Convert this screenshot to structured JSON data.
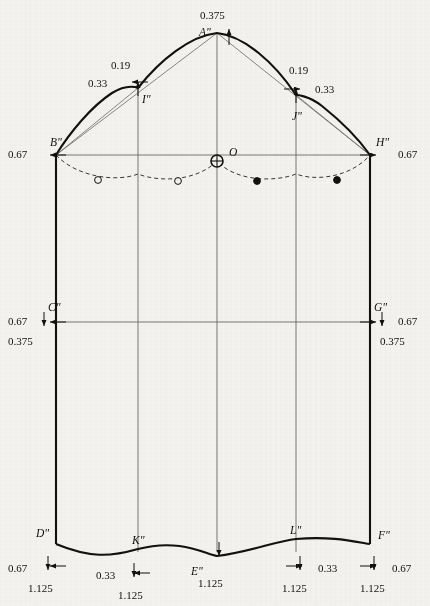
{
  "figure": {
    "kind": "technical-pattern-drafting-diagram",
    "background_color": "#f4f2ee",
    "ink_color": "#111111",
    "line_color_thin": "#555555"
  },
  "points": [
    {
      "id": "A",
      "label": "A\"",
      "x": 217,
      "y": 33,
      "label_dx": -18,
      "label_dy": -6
    },
    {
      "id": "B",
      "label": "B\"",
      "x": 56,
      "y": 155,
      "label_dx": -6,
      "label_dy": -18
    },
    {
      "id": "C",
      "label": "C\"",
      "x": 56,
      "y": 322,
      "label_dx": -8,
      "label_dy": -20
    },
    {
      "id": "D",
      "label": "D\"",
      "x": 56,
      "y": 544,
      "label_dx": -20,
      "label_dy": -16
    },
    {
      "id": "E",
      "label": "E\"",
      "x": 217,
      "y": 556,
      "label_dx": -26,
      "label_dy": 10
    },
    {
      "id": "F",
      "label": "F\"",
      "x": 370,
      "y": 544,
      "label_dx": 8,
      "label_dy": -14
    },
    {
      "id": "G",
      "label": "G\"",
      "x": 370,
      "y": 322,
      "label_dx": 4,
      "label_dy": -20
    },
    {
      "id": "H",
      "label": "H\"",
      "x": 370,
      "y": 155,
      "label_dx": 6,
      "label_dy": -18
    },
    {
      "id": "I",
      "label": "I\"",
      "x": 138,
      "y": 88,
      "label_dx": 4,
      "label_dy": 6
    },
    {
      "id": "J",
      "label": "J\"",
      "x": 296,
      "y": 95,
      "label_dx": -4,
      "label_dy": 16
    },
    {
      "id": "K",
      "label": "K\"",
      "x": 138,
      "y": 549,
      "label_dx": -6,
      "label_dy": -14
    },
    {
      "id": "L",
      "label": "L\"",
      "x": 296,
      "y": 539,
      "label_dx": -6,
      "label_dy": -14
    },
    {
      "id": "O",
      "label": "O",
      "x": 217,
      "y": 161,
      "label_dx": 12,
      "label_dy": -14
    }
  ],
  "dimensions": [
    {
      "id": "a-up",
      "value": "0.375",
      "near": "A\"",
      "direction": "up",
      "text_x": 200,
      "text_y": 10,
      "arrow_x": 229,
      "arrow_y": 29,
      "arrow_len": 16
    },
    {
      "id": "i-up",
      "value": "0.19",
      "near": "I\"",
      "direction": "up",
      "text_x": 111,
      "text_y": 60,
      "arrow_x": 138,
      "arrow_y": 82,
      "arrow_len": 14
    },
    {
      "id": "i-left",
      "value": "0.33",
      "near": "I\"",
      "direction": "left",
      "text_x": 88,
      "text_y": 78,
      "arrow_x": 132,
      "arrow_y": 82,
      "arrow_len": 16
    },
    {
      "id": "j-up",
      "value": "0.19",
      "near": "J\"",
      "direction": "up",
      "text_x": 289,
      "text_y": 65,
      "arrow_x": 296,
      "arrow_y": 89,
      "arrow_len": 14
    },
    {
      "id": "j-right",
      "value": "0.33",
      "near": "J\"",
      "direction": "right",
      "text_x": 315,
      "text_y": 84,
      "arrow_x": 300,
      "arrow_y": 89,
      "arrow_len": 16
    },
    {
      "id": "b-left",
      "value": "0.67",
      "near": "B\"",
      "direction": "left",
      "text_x": 8,
      "text_y": 149,
      "arrow_x": 50,
      "arrow_y": 155,
      "arrow_len": 16
    },
    {
      "id": "h-right",
      "value": "0.67",
      "near": "H\"",
      "direction": "right",
      "text_x": 398,
      "text_y": 149,
      "arrow_x": 376,
      "arrow_y": 155,
      "arrow_len": 16
    },
    {
      "id": "c-left",
      "value": "0.67",
      "near": "C\"",
      "direction": "left",
      "text_x": 8,
      "text_y": 316,
      "arrow_x": 50,
      "arrow_y": 322,
      "arrow_len": 16
    },
    {
      "id": "c-down",
      "value": "0.375",
      "near": "C\"",
      "direction": "down",
      "text_x": 8,
      "text_y": 336,
      "arrow_x": 44,
      "arrow_y": 326,
      "arrow_len": 14
    },
    {
      "id": "g-right",
      "value": "0.67",
      "near": "G\"",
      "direction": "right",
      "text_x": 398,
      "text_y": 316,
      "arrow_x": 376,
      "arrow_y": 322,
      "arrow_len": 16
    },
    {
      "id": "g-down",
      "value": "0.375",
      "near": "G\"",
      "direction": "down",
      "text_x": 380,
      "text_y": 336,
      "arrow_x": 382,
      "arrow_y": 326,
      "arrow_len": 14
    },
    {
      "id": "d-left",
      "value": "0.67",
      "near": "D\"",
      "direction": "left",
      "text_x": 8,
      "text_y": 563,
      "arrow_x": 50,
      "arrow_y": 566,
      "arrow_len": 16
    },
    {
      "id": "d-down",
      "value": "1.125",
      "near": "D\"",
      "direction": "down",
      "text_x": 28,
      "text_y": 583,
      "arrow_x": 48,
      "arrow_y": 570,
      "arrow_len": 14
    },
    {
      "id": "k-left",
      "value": "0.33",
      "near": "K\"",
      "direction": "left",
      "text_x": 96,
      "text_y": 570,
      "arrow_x": 134,
      "arrow_y": 573,
      "arrow_len": 16
    },
    {
      "id": "k-down",
      "value": "1.125",
      "near": "K\"",
      "direction": "down",
      "text_x": 118,
      "text_y": 590,
      "arrow_x": 134,
      "arrow_y": 577,
      "arrow_len": 14
    },
    {
      "id": "e-down",
      "value": "1.125",
      "near": "E\"",
      "direction": "down",
      "text_x": 198,
      "text_y": 578,
      "arrow_x": 219,
      "arrow_y": 556,
      "arrow_len": 14
    },
    {
      "id": "l-right",
      "value": "0.33",
      "near": "L\"",
      "direction": "right",
      "text_x": 318,
      "text_y": 563,
      "arrow_x": 302,
      "arrow_y": 566,
      "arrow_len": 16
    },
    {
      "id": "l-down",
      "value": "1.125",
      "near": "L\"",
      "direction": "down",
      "text_x": 282,
      "text_y": 583,
      "arrow_x": 300,
      "arrow_y": 570,
      "arrow_len": 14
    },
    {
      "id": "f-right",
      "value": "0.67",
      "near": "F\"",
      "direction": "right",
      "text_x": 392,
      "text_y": 563,
      "arrow_x": 376,
      "arrow_y": 566,
      "arrow_len": 16
    },
    {
      "id": "f-down",
      "value": "1.125",
      "near": "F\"",
      "direction": "down",
      "text_x": 360,
      "text_y": 583,
      "arrow_x": 374,
      "arrow_y": 570,
      "arrow_len": 14
    }
  ],
  "markers": {
    "scye_curve_points": [
      {
        "x": 98,
        "y": 180,
        "filled": false
      },
      {
        "x": 178,
        "y": 181,
        "filled": false
      },
      {
        "x": 257,
        "y": 181,
        "filled": true
      },
      {
        "x": 337,
        "y": 180,
        "filled": true
      }
    ],
    "origin_marker": {
      "x": 217,
      "y": 161,
      "type": "crossed-circle"
    }
  },
  "geometry": {
    "gridlines_vertical_x": [
      56,
      138,
      217,
      296,
      370
    ],
    "gridline_horizontal_y": [
      155,
      322
    ],
    "cap_outline_path": "M 56 155 C 70 132 92 106 112 93 C 128 83 138 88 138 88 C 160 60 190 36 217 33 C 244 36 274 62 296 95 C 296 95 308 95 322 106 C 342 122 358 138 370 155",
    "chord_left_path": "M 56 155 L 217 33",
    "chord_right_path": "M 217 33 L 370 155",
    "chord_through_I": "M 56 155 L 138 88",
    "chord_through_J": "M 296 95 L 370 155",
    "side_left_path": "M 56 155 L 56 525 C 56 536 56 540 56 544",
    "side_right_path": "M 370 155 L 370 525 C 370 536 370 540 370 544",
    "hem_path": "M 56 544 C 90 558 110 557 138 549 C 180 538 205 554 217 556 C 250 552 276 541 296 539 C 330 536 352 541 370 544",
    "scye_dashed_path": "M 56 155 C 78 178 118 182 138 174 C 158 182 196 182 217 161 C 236 182 276 182 296 174 C 318 182 352 176 370 155"
  },
  "legend": {
    "note": ""
  }
}
